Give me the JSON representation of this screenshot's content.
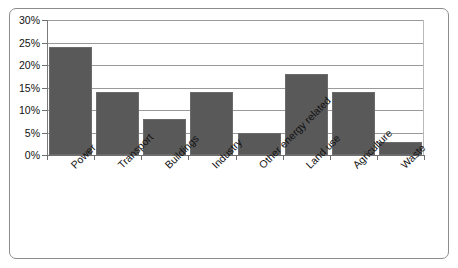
{
  "chart_data": {
    "type": "bar",
    "title": "",
    "subtitle": "",
    "xlabel": "",
    "ylabel": "",
    "categories": [
      "Power",
      "Transport",
      "Buildings",
      "Industry",
      "Other energy related",
      "Land use",
      "Agriculture",
      "Waste"
    ],
    "values": [
      24,
      14,
      8,
      14,
      5,
      18,
      14,
      3
    ],
    "ylim": [
      0,
      30
    ],
    "ytick_labels": [
      "0%",
      "5%",
      "10%",
      "15%",
      "20%",
      "25%",
      "30%"
    ],
    "ytick_values": [
      0,
      5,
      10,
      15,
      20,
      25,
      30
    ],
    "grid": true,
    "legend": false,
    "legend_position": "none",
    "value_suffix": "%",
    "bar_color": "#595959",
    "grid_color": "#9a9a9a",
    "axis_color": "#6f6f6f",
    "frame_color": "#8d8d8d",
    "background_color": "#ffffff",
    "xlabel_rotation": -45
  }
}
